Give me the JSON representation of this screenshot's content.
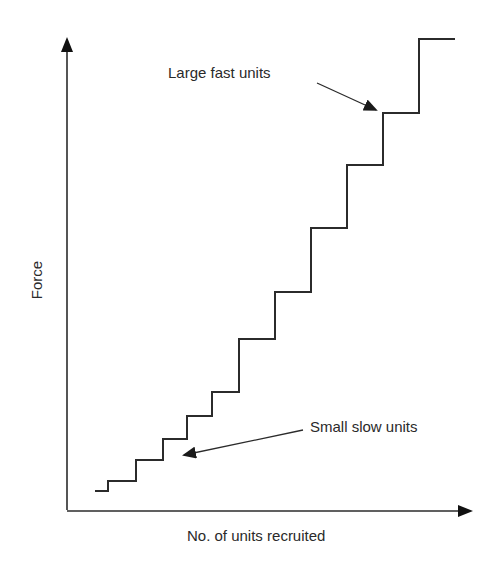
{
  "figure": {
    "top_fragment": "",
    "colors": {
      "line": "#2b2b2b",
      "text": "#2a2a2a",
      "background": "#ffffff"
    }
  },
  "chart_data": {
    "type": "line",
    "subtype": "step",
    "title": "",
    "xlabel": "No. of units recruited",
    "ylabel": "Force",
    "grid": false,
    "legend": null,
    "ticks": {
      "x": [],
      "y": []
    },
    "series": [
      {
        "name": "Motor unit recruitment (size principle)",
        "x": [
          1,
          2,
          3,
          4,
          5,
          6,
          7,
          8,
          9,
          10,
          11,
          12
        ],
        "y": [
          19,
          29,
          50,
          71,
          94,
          118,
          171,
          218,
          282,
          345,
          397,
          471
        ],
        "step_widths_px": [
          13,
          28,
          27,
          24,
          25,
          27,
          36,
          36,
          36,
          36,
          36,
          36
        ],
        "pixel_path": [
          [
            95,
            491
          ],
          [
            108,
            491
          ],
          [
            108,
            481
          ],
          [
            136,
            481
          ],
          [
            136,
            460
          ],
          [
            163,
            460
          ],
          [
            163,
            439
          ],
          [
            187,
            439
          ],
          [
            187,
            416
          ],
          [
            212,
            416
          ],
          [
            212,
            392
          ],
          [
            239,
            392
          ],
          [
            239,
            339
          ],
          [
            275,
            339
          ],
          [
            275,
            292
          ],
          [
            311,
            292
          ],
          [
            311,
            228
          ],
          [
            347,
            228
          ],
          [
            347,
            165
          ],
          [
            383,
            165
          ],
          [
            383,
            113
          ],
          [
            419,
            113
          ],
          [
            419,
            39
          ],
          [
            455,
            39
          ]
        ]
      }
    ],
    "annotations": [
      {
        "text": "Large fast units",
        "arrow_from": [
          317,
          83
        ],
        "arrow_to": [
          376,
          110
        ]
      },
      {
        "text": "Small slow units",
        "arrow_from": [
          303,
          430
        ],
        "arrow_to": [
          184,
          455
        ]
      }
    ]
  },
  "labels": {
    "x_axis": "No. of units recruited",
    "y_axis": "Force",
    "large_units": "Large fast units",
    "small_units": "Small slow units"
  }
}
